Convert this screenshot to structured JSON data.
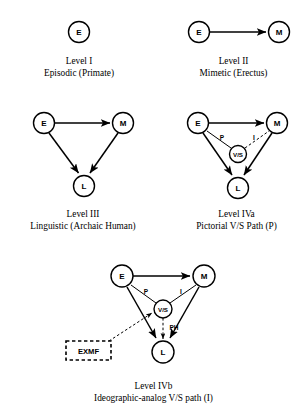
{
  "figure": {
    "type": "diagram",
    "style": "node-link evolutionary stage diagram",
    "panels": [
      {
        "id": "level-1",
        "caption_line1": "Level I",
        "caption_line2": "Episodic (Primate)",
        "nodes": [
          {
            "id": "E",
            "label": "E",
            "cx": 79,
            "cy": 32,
            "r": 10.5
          }
        ],
        "edges": [],
        "boxes": []
      },
      {
        "id": "level-2",
        "caption_line1": "Level II",
        "caption_line2": "Mimetic (Erectus)",
        "nodes": [
          {
            "id": "E",
            "label": "E",
            "cx": 199,
            "cy": 32,
            "r": 10.5
          },
          {
            "id": "M",
            "label": "M",
            "cx": 279,
            "cy": 32,
            "r": 10.5
          }
        ],
        "edges": [
          {
            "from": "E",
            "to": "M",
            "style": "solid",
            "arrow": "end",
            "label": ""
          }
        ],
        "boxes": []
      },
      {
        "id": "level-3",
        "caption_line1": "Level III",
        "caption_line2": "Linguistic (Archaic Human)",
        "nodes": [
          {
            "id": "E",
            "label": "E",
            "cx": 44,
            "cy": 123,
            "r": 10.5
          },
          {
            "id": "M",
            "label": "M",
            "cx": 123,
            "cy": 123,
            "r": 10.5
          },
          {
            "id": "L",
            "label": "L",
            "cx": 84,
            "cy": 186,
            "r": 10.5
          }
        ],
        "edges": [
          {
            "from": "E",
            "to": "M",
            "style": "solid",
            "arrow": "end",
            "label": ""
          },
          {
            "from": "E",
            "to": "L",
            "style": "solid",
            "arrow": "end",
            "label": ""
          },
          {
            "from": "M",
            "to": "L",
            "style": "solid",
            "arrow": "end",
            "label": ""
          }
        ],
        "boxes": []
      },
      {
        "id": "level-4a",
        "caption_line1": "Level IVa",
        "caption_line2": "Pictorial V/S Path (P)",
        "nodes": [
          {
            "id": "E",
            "label": "E",
            "cx": 198,
            "cy": 123,
            "r": 10.5
          },
          {
            "id": "M",
            "label": "M",
            "cx": 277,
            "cy": 123,
            "r": 10.5
          },
          {
            "id": "VS",
            "label": "V/S",
            "cx": 238,
            "cy": 154,
            "r": 8.5
          },
          {
            "id": "L",
            "label": "L",
            "cx": 238,
            "cy": 188,
            "r": 10.5
          }
        ],
        "edges": [
          {
            "from": "E",
            "to": "M",
            "style": "solid",
            "arrow": "end",
            "label": ""
          },
          {
            "from": "E",
            "to": "L",
            "style": "solid",
            "arrow": "end",
            "label": ""
          },
          {
            "from": "M",
            "to": "L",
            "style": "solid",
            "arrow": "end",
            "label": ""
          },
          {
            "from": "E",
            "to": "VS",
            "style": "thin",
            "arrow": "none",
            "label": "P"
          },
          {
            "from": "VS",
            "to": "M",
            "style": "dashed",
            "arrow": "none",
            "label": "I"
          }
        ],
        "boxes": []
      },
      {
        "id": "level-4b",
        "caption_line1": "Level IVb",
        "caption_line2": "Ideographic-analog V/S path (I)",
        "nodes": [
          {
            "id": "E",
            "label": "E",
            "cx": 122,
            "cy": 276,
            "r": 11
          },
          {
            "id": "M",
            "label": "M",
            "cx": 204,
            "cy": 276,
            "r": 11
          },
          {
            "id": "VS",
            "label": "V/S",
            "cx": 163,
            "cy": 309,
            "r": 9
          },
          {
            "id": "L",
            "label": "L",
            "cx": 163,
            "cy": 352,
            "r": 11
          }
        ],
        "edges": [
          {
            "from": "E",
            "to": "M",
            "style": "solid",
            "arrow": "end",
            "label": ""
          },
          {
            "from": "E",
            "to": "L",
            "style": "solid",
            "arrow": "end",
            "label": ""
          },
          {
            "from": "M",
            "to": "L",
            "style": "solid",
            "arrow": "end",
            "label": ""
          },
          {
            "from": "E",
            "to": "VS",
            "style": "thin",
            "arrow": "none",
            "label": "P"
          },
          {
            "from": "VS",
            "to": "M",
            "style": "thin",
            "arrow": "none",
            "label": "I"
          },
          {
            "from": "VS",
            "to": "L",
            "style": "dashed",
            "arrow": "end",
            "label": "PH"
          },
          {
            "from": "EXMF",
            "to": "VS",
            "style": "dashed",
            "arrow": "end",
            "label": ""
          }
        ],
        "boxes": [
          {
            "id": "EXMF",
            "label": "EXMF",
            "x": 66,
            "y": 341,
            "w": 45,
            "h": 19
          }
        ]
      }
    ]
  },
  "captions": {
    "level1": {
      "line1": "Level I",
      "line2": "Episodic (Primate)"
    },
    "level2": {
      "line1": "Level II",
      "line2": "Mimetic (Erectus)"
    },
    "level3": {
      "line1": "Level III",
      "line2": "Linguistic (Archaic Human)"
    },
    "level4a": {
      "line1": "Level IVa",
      "line2": "Pictorial V/S Path (P)"
    },
    "level4b": {
      "line1": "Level IVb",
      "line2": "Ideographic-analog V/S path (I)"
    }
  },
  "node_labels": {
    "E": "E",
    "M": "M",
    "L": "L",
    "VS": "V/S",
    "EXMF": "EXMF"
  },
  "edge_labels": {
    "P": "P",
    "I": "I",
    "PH": "PH"
  },
  "colors": {
    "ink": "#000000",
    "paper": "#ffffff"
  }
}
